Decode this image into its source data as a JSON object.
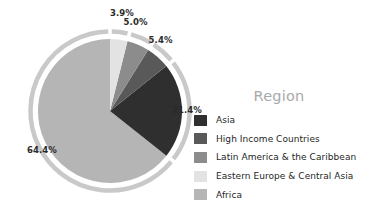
{
  "chart_data": {
    "type": "pie",
    "title": "Region",
    "legend_position": "right",
    "grid": false,
    "categories": [
      "Asia",
      "High Income Countries",
      "Latin America & the Caribbean",
      "Eastern Europe & Central Asia",
      "Africa"
    ],
    "values": [
      21.4,
      5.4,
      5.0,
      3.9,
      64.4
    ],
    "value_labels": [
      "21.4%",
      "5.4%",
      "5.0%",
      "3.9%",
      "64.4%"
    ],
    "unit": "%",
    "colors": [
      "#2f2f2f",
      "#595959",
      "#8c8c8c",
      "#e3e3e3",
      "#b5b5b5"
    ],
    "slices": [
      {
        "label": "Africa",
        "value": 64.4,
        "value_label": "64.4%",
        "color": "#b5b5b5"
      },
      {
        "label": "Asia",
        "value": 21.4,
        "value_label": "21.4%",
        "color": "#2f2f2f"
      },
      {
        "label": "High Income Countries",
        "value": 5.4,
        "value_label": "5.4%",
        "color": "#595959"
      },
      {
        "label": "Latin America & the Caribbean",
        "value": 5.0,
        "value_label": "5.0%",
        "color": "#8c8c8c"
      },
      {
        "label": "Eastern Europe & Central Asia",
        "value": 3.9,
        "value_label": "3.9%",
        "color": "#e3e3e3"
      }
    ]
  },
  "legend": {
    "title": "Region",
    "items": [
      {
        "label": "Asia",
        "color": "#2f2f2f"
      },
      {
        "label": "High Income Countries",
        "color": "#595959"
      },
      {
        "label": "Latin America & the Caribbean",
        "color": "#8c8c8c"
      },
      {
        "label": "Eastern Europe & Central Asia",
        "color": "#e3e3e3"
      },
      {
        "label": "Africa",
        "color": "#b5b5b5"
      }
    ]
  },
  "pct_labels": {
    "africa": "64.4%",
    "asia": "21.4%",
    "high_income": "5.4%",
    "latin_america": "5.0%",
    "eastern_europe": "3.9%"
  },
  "ring": {
    "color": "#c9c9c9"
  }
}
